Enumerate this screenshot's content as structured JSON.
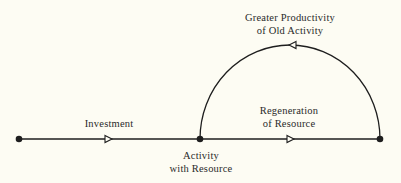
{
  "diagram": {
    "nodes": [
      {
        "id": "start",
        "x": 19,
        "y": 139
      },
      {
        "id": "activity",
        "x": 200,
        "y": 139,
        "label_lines": [
          "Activity",
          "with Resource"
        ]
      },
      {
        "id": "end",
        "x": 380,
        "y": 139
      }
    ],
    "edges": [
      {
        "from": "start",
        "to": "activity",
        "label": "Investment",
        "type": "line"
      },
      {
        "from": "activity",
        "to": "end",
        "label_lines": [
          "Regeneration",
          "of Resource"
        ],
        "type": "line"
      },
      {
        "from": "end",
        "to": "activity",
        "label_lines": [
          "Greater Productivity",
          "of Old Activity"
        ],
        "type": "arc"
      }
    ]
  },
  "labels": {
    "investment": "Investment",
    "activity_line1": "Activity",
    "activity_line2": "with Resource",
    "regeneration_line1": "Regeneration",
    "regeneration_line2": "of Resource",
    "productivity_line1": "Greater Productivity",
    "productivity_line2": "of Old Activity"
  },
  "colors": {
    "background": "#fdfcf3",
    "ink": "#1e1e1e"
  }
}
